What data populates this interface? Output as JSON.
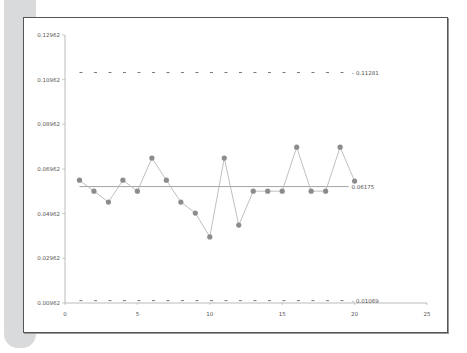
{
  "chart_data": {
    "type": "line",
    "title": "",
    "xlabel": "",
    "ylabel": "",
    "xlim": [
      0,
      25
    ],
    "ylim": [
      0.00962,
      0.12962
    ],
    "x_ticks": [
      "0",
      "5",
      "10",
      "15",
      "20",
      "25"
    ],
    "y_ticks": [
      "0.12962",
      "0.10962",
      "0.08962",
      "0.06962",
      "0.04962",
      "0.02962",
      "0.00962"
    ],
    "grid": false,
    "legend": "none",
    "series": [
      {
        "name": "proportion",
        "x": [
          1,
          2,
          3,
          4,
          5,
          6,
          7,
          8,
          9,
          10,
          11,
          12,
          13,
          14,
          15,
          16,
          17,
          18,
          19,
          20
        ],
        "values": [
          0.0646,
          0.0597,
          0.0548,
          0.0646,
          0.0597,
          0.0745,
          0.0646,
          0.0548,
          0.0499,
          0.0392,
          0.0745,
          0.0445,
          0.0597,
          0.0597,
          0.0597,
          0.0794,
          0.0597,
          0.0597,
          0.0794,
          0.0642
        ]
      }
    ],
    "reference_lines": [
      {
        "name": "UCL",
        "value": 0.11281,
        "label": "0.11281",
        "style": "dashed"
      },
      {
        "name": "CL",
        "value": 0.06175,
        "label": "0.06175",
        "style": "solid"
      },
      {
        "name": "LCL",
        "value": 0.01069,
        "label": "0.01069",
        "style": "dashed"
      }
    ]
  },
  "colors": {
    "line": "#b8b8b8",
    "marker": "#8c8c8c",
    "center_line": "#9a9a9a",
    "limit_line": "#666666",
    "axis": "#aaaaaa",
    "frame": "#555555"
  }
}
